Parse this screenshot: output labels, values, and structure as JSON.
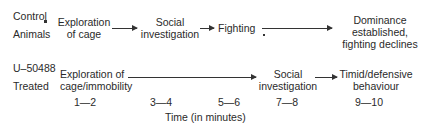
{
  "control": {
    "label_line1": "Control",
    "label_line2": "Animals",
    "stages": [
      {
        "line1": "Exploration",
        "line2": "of cage"
      },
      {
        "line1": "Social",
        "line2": "investigation"
      },
      {
        "line1": "Fighting"
      },
      {
        "line1": "Dominance",
        "line2": "established,",
        "line3": "fighting declines"
      }
    ]
  },
  "treated": {
    "label_line1": "U–50488",
    "label_line2": "Treated",
    "stages": [
      {
        "line1": "Exploration of",
        "line2": "cage/immobility"
      },
      {
        "line1": "Social",
        "line2": "investigation"
      },
      {
        "line1": "Timid/defensive",
        "line2": "behaviour"
      }
    ]
  },
  "time_axis": {
    "ticks": [
      "1—2",
      "3—4",
      "5—6",
      "7—8",
      "9—10"
    ],
    "label": "Time (in minutes)"
  }
}
